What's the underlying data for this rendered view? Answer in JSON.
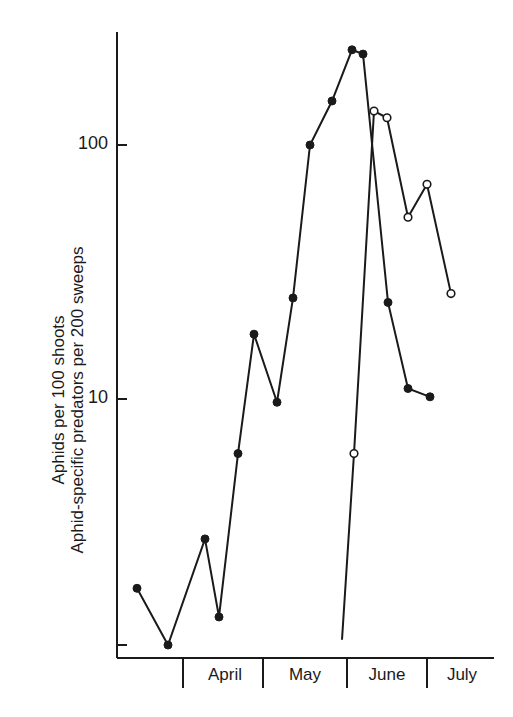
{
  "chart_data": {
    "type": "line",
    "title": "",
    "xlabel": "",
    "ylabel_lines": [
      "Aphids per 100 shoots",
      "Aphid-specific predators per 200 sweeps"
    ],
    "yscale": "log",
    "ylim": [
      1,
      280
    ],
    "y_ticks": [
      {
        "value": 1,
        "label": ""
      },
      {
        "value": 10,
        "label": "10"
      },
      {
        "value": 100,
        "label": "100"
      }
    ],
    "x_month_labels": [
      "April",
      "May",
      "June",
      "July"
    ],
    "grid": false,
    "legend": null,
    "series": [
      {
        "name": "Aphids per 100 shoots",
        "marker": "filled-circle",
        "points": [
          {
            "x": 137,
            "value": 1.7
          },
          {
            "x": 168,
            "value": 1.0
          },
          {
            "x": 205,
            "value": 2.7
          },
          {
            "x": 219,
            "value": 1.3
          },
          {
            "x": 238,
            "value": 6.0
          },
          {
            "x": 254,
            "value": 18
          },
          {
            "x": 277,
            "value": 9.7
          },
          {
            "x": 293,
            "value": 25
          },
          {
            "x": 310,
            "value": 100
          },
          {
            "x": 332,
            "value": 149
          },
          {
            "x": 352,
            "value": 237
          },
          {
            "x": 363,
            "value": 228
          },
          {
            "x": 388,
            "value": 24
          },
          {
            "x": 408,
            "value": 11
          },
          {
            "x": 430,
            "value": 10.2
          }
        ]
      },
      {
        "name": "Aphid-specific predators per 200 sweeps",
        "marker": "open-circle",
        "start_without_marker": {
          "x": 342,
          "value": 1.05
        },
        "points": [
          {
            "x": 354,
            "value": 6.0
          },
          {
            "x": 374,
            "value": 136
          },
          {
            "x": 387,
            "value": 128
          },
          {
            "x": 408,
            "value": 52
          },
          {
            "x": 427,
            "value": 70
          },
          {
            "x": 451,
            "value": 26
          }
        ]
      }
    ]
  },
  "axis": {
    "tick_100": "100",
    "tick_10": "10",
    "months": {
      "april": "April",
      "may": "May",
      "june": "June",
      "july": "July"
    },
    "ylabel_line1": "Aphids per 100 shoots",
    "ylabel_line2": "Aphid-specific predators per 200 sweeps"
  },
  "colors": {
    "ink": "#1a1a1a",
    "background": "#ffffff"
  }
}
